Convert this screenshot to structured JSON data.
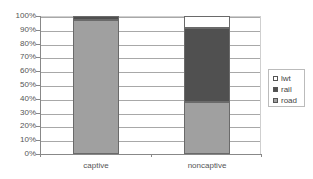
{
  "chart_data": {
    "type": "bar",
    "stacked": true,
    "percent": true,
    "title": "",
    "xlabel": "",
    "ylabel": "",
    "categories": [
      "captive",
      "noncaptive"
    ],
    "series": [
      {
        "name": "road",
        "color": "#a0a0a0",
        "values": [
          97,
          38
        ]
      },
      {
        "name": "rail",
        "color": "#505050",
        "values": [
          3,
          53
        ]
      },
      {
        "name": "lwt",
        "color": "#ffffff",
        "values": [
          0,
          9
        ]
      }
    ],
    "ylim": [
      0,
      100
    ],
    "yticks": [
      "0%",
      "10%",
      "20%",
      "30%",
      "40%",
      "50%",
      "60%",
      "70%",
      "80%",
      "90%",
      "100%"
    ],
    "grid": true,
    "legend": {
      "position": "right",
      "entries": [
        "lwt",
        "rail",
        "road"
      ]
    }
  }
}
